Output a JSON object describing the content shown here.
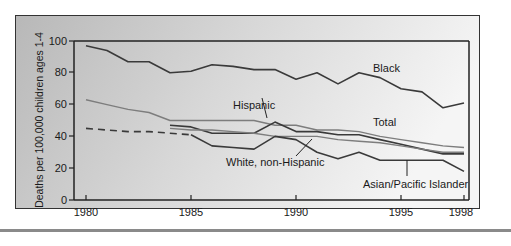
{
  "chart_data": {
    "type": "line",
    "title": "",
    "xlabel": "",
    "ylabel": "Deaths per 100,000 children ages 1-4",
    "xlim": [
      1980,
      1998
    ],
    "ylim": [
      0,
      100
    ],
    "x_ticks": [
      1980,
      1985,
      1990,
      1995,
      1998
    ],
    "y_ticks": [
      0,
      20,
      40,
      60,
      80,
      100
    ],
    "grid": false,
    "legend": "inline labels",
    "x": [
      1980,
      1981,
      1982,
      1983,
      1984,
      1985,
      1986,
      1987,
      1988,
      1989,
      1990,
      1991,
      1992,
      1993,
      1994,
      1995,
      1996,
      1997,
      1998
    ],
    "series": [
      {
        "name": "Black",
        "style": "solid-dark",
        "values": [
          97,
          94,
          87,
          87,
          80,
          81,
          85,
          84,
          82,
          82,
          76,
          80,
          73,
          80,
          77,
          70,
          68,
          58,
          61
        ]
      },
      {
        "name": "Total",
        "style": "solid-light",
        "values": [
          63,
          60,
          57,
          55,
          50,
          50,
          50,
          50,
          50,
          47,
          47,
          44,
          44,
          43,
          40,
          38,
          36,
          34,
          33
        ]
      },
      {
        "name": "Hispanic",
        "style": "solid-dark",
        "values": [
          null,
          null,
          null,
          null,
          47,
          46,
          42,
          42,
          42,
          49,
          43,
          43,
          41,
          41,
          38,
          35,
          32,
          29,
          29
        ]
      },
      {
        "name": "White, non-Hispanic",
        "style": "solid-light",
        "values": [
          null,
          null,
          null,
          null,
          45,
          44,
          44,
          43,
          42,
          40,
          40,
          40,
          38,
          37,
          36,
          34,
          32,
          30,
          30
        ]
      },
      {
        "name": "Asian/Pacific Islander",
        "style": "solid-dark",
        "values": [
          null,
          null,
          null,
          null,
          null,
          41,
          34,
          33,
          32,
          40,
          38,
          30,
          26,
          30,
          25,
          25,
          25,
          25,
          18
        ]
      },
      {
        "name": "Asian/Pacific Islander (estimated, dashed)",
        "style": "dashed-dark",
        "values": [
          45,
          44,
          43,
          43,
          42,
          41,
          null,
          null,
          null,
          null,
          null,
          null,
          null,
          null,
          null,
          null,
          null,
          null,
          null
        ]
      }
    ],
    "annotations": [
      {
        "text": "Black",
        "x": 1993.2,
        "y": 83
      },
      {
        "text": "Hispanic",
        "x": 1986.6,
        "y": 56
      },
      {
        "text": "Total",
        "x": 1993.2,
        "y": 47
      },
      {
        "text": "White, non-Hispanic",
        "x": 1986.3,
        "y": 21
      },
      {
        "text": "Asian/Pacific Islander",
        "x": 1993.2,
        "y": 8
      }
    ]
  },
  "labels": {
    "ylabel": "Deaths per 100,000 children ages 1-4",
    "y_ticks": [
      "0",
      "20",
      "40",
      "60",
      "80",
      "100"
    ],
    "x_ticks": [
      "1980",
      "1985",
      "1990",
      "1995",
      "1998"
    ],
    "series": {
      "black": "Black",
      "hispanic": "Hispanic",
      "total": "Total",
      "white": "White, non-Hispanic",
      "asian": "Asian/Pacific Islander"
    }
  }
}
